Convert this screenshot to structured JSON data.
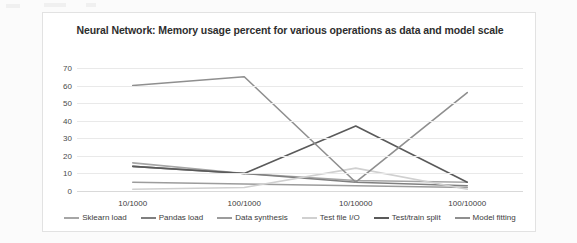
{
  "chart_data": {
    "type": "line",
    "title": "Neural Network: Memory usage percent for various operations as data and model scale",
    "xlabel": "",
    "ylabel": "",
    "categories": [
      "10/1000",
      "100/1000",
      "10/10000",
      "100/10000"
    ],
    "ylim": [
      0,
      70
    ],
    "yticks": [
      0,
      10,
      20,
      30,
      40,
      50,
      60,
      70
    ],
    "grid": true,
    "legend_position": "bottom",
    "series": [
      {
        "name": "Sklearn load",
        "values": [
          16,
          10,
          6,
          5
        ],
        "color": "#a6a6a6"
      },
      {
        "name": "Pandas load",
        "values": [
          14,
          10,
          5,
          3
        ],
        "color": "#7f7f7f"
      },
      {
        "name": "Data synthesis",
        "values": [
          5,
          4,
          3,
          2
        ],
        "color": "#9c9c9c"
      },
      {
        "name": "Test file I/O",
        "values": [
          1,
          2,
          13,
          1
        ],
        "color": "#d0d0d0"
      },
      {
        "name": "Test/train split",
        "values": [
          14,
          10,
          37,
          5
        ],
        "color": "#5a5a5a"
      },
      {
        "name": "Model fitting",
        "values": [
          60,
          65,
          5,
          56
        ],
        "color": "#8f8f8f"
      }
    ]
  }
}
